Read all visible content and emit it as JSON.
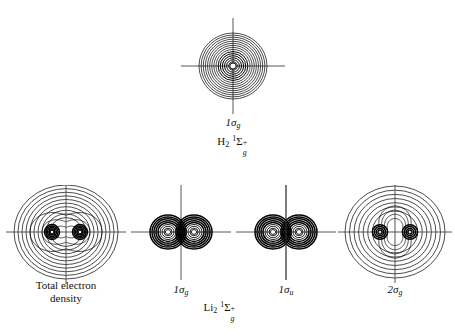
{
  "figure": {
    "kind": "molecular-orbital-contour-diagram",
    "background": "#ffffff",
    "ink": "#000000"
  },
  "top_molecule": {
    "label_parts": {
      "formula": "H",
      "sub": "2",
      "term_pre": "1",
      "term": "Σ",
      "term_sub": "g",
      "term_sup": "+"
    },
    "label_text": "H₂ ¹Σₕ⁺"
  },
  "bottom_molecule": {
    "label_parts": {
      "formula": "Li",
      "sub": "2",
      "term_pre": "1",
      "term": "Σ",
      "term_sub": "g",
      "term_sup": "+"
    },
    "label_text": "Li₂ ¹Σₕ⁺"
  },
  "panels": [
    {
      "id": "h2-1sg",
      "caption": "1σ",
      "caption_sub": "g",
      "caption_lines": [
        "1σg"
      ],
      "row": "top",
      "x": 177,
      "y": 18,
      "w": 112,
      "h": 100,
      "center_x": 56,
      "center_y": 48,
      "type": "atomic-like",
      "nuclei": [
        {
          "dx": 0,
          "dy": 0
        }
      ],
      "contour_count": 16,
      "outer_rx": 34,
      "outer_ry": 33,
      "axis_h_len": 52,
      "axis_v_len": 48
    },
    {
      "id": "li2-total",
      "caption": "Total electron",
      "caption_line2": "density",
      "caption_lines": [
        "Total electron",
        "density"
      ],
      "row": "bottom",
      "x": 6,
      "y": 185,
      "w": 120,
      "h": 100,
      "center_x": 60,
      "center_y": 47,
      "type": "total-density",
      "nuclei": [
        {
          "dx": -14,
          "dy": 0
        },
        {
          "dx": 14,
          "dy": 0
        }
      ],
      "contour_count": 13,
      "outer_rx": 52,
      "outer_ry": 47,
      "core_count": 5,
      "axis_h_len": 60,
      "axis_v_len": 52
    },
    {
      "id": "li2-1sg",
      "caption": "1σ",
      "caption_sub": "g",
      "caption_lines": [
        "1σg"
      ],
      "row": "bottom",
      "x": 129,
      "y": 185,
      "w": 104,
      "h": 100,
      "center_x": 52,
      "center_y": 47,
      "type": "core-bonding",
      "nuclei": [
        {
          "dx": -13,
          "dy": 0
        },
        {
          "dx": 13,
          "dy": 0
        }
      ],
      "contour_count": 9,
      "core_rx": 18,
      "core_ry": 17,
      "axis_h_len": 50,
      "axis_v_len": 48
    },
    {
      "id": "li2-1su",
      "caption": "1σ",
      "caption_sub": "u",
      "caption_lines": [
        "1σu"
      ],
      "row": "bottom",
      "x": 234,
      "y": 185,
      "w": 104,
      "h": 100,
      "center_x": 52,
      "center_y": 47,
      "type": "core-antibonding",
      "nuclei": [
        {
          "dx": -13,
          "dy": 0
        },
        {
          "dx": 13,
          "dy": 0
        }
      ],
      "contour_count": 9,
      "core_rx": 18,
      "core_ry": 17,
      "axis_h_len": 50,
      "axis_v_len": 48
    },
    {
      "id": "li2-2sg",
      "caption": "2σ",
      "caption_sub": "g",
      "caption_lines": [
        "2σg"
      ],
      "row": "bottom",
      "x": 338,
      "y": 185,
      "w": 114,
      "h": 100,
      "center_x": 57,
      "center_y": 47,
      "type": "valence-waisted",
      "nuclei": [
        {
          "dx": -15,
          "dy": 0
        },
        {
          "dx": 15,
          "dy": 0
        }
      ],
      "contour_count": 11,
      "outer_rx": 50,
      "outer_ry": 46,
      "axis_h_len": 58,
      "axis_v_len": 51
    }
  ]
}
